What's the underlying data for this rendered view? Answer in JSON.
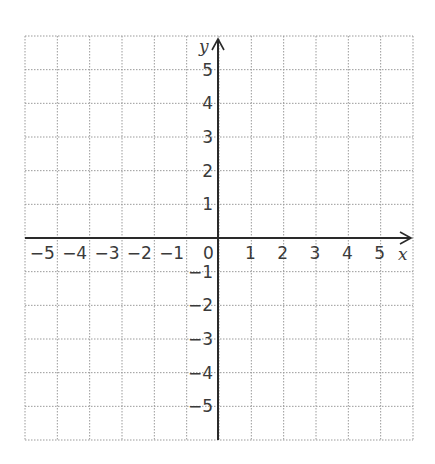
{
  "diagram": {
    "type": "cartesian-coordinate-grid",
    "grid": {
      "x_min": -6,
      "x_max": 6,
      "y_min": -6,
      "y_max": 6,
      "cells_x": 12,
      "cells_y": 12,
      "line_style": "dotted",
      "line_color": "#9a9a9a"
    },
    "axes": {
      "x_label": "x",
      "y_label": "y",
      "color": "#2a2a2a"
    },
    "origin_label": "0",
    "x_ticks": [
      {
        "value": -5,
        "label": "−5"
      },
      {
        "value": -4,
        "label": "−4"
      },
      {
        "value": -3,
        "label": "−3"
      },
      {
        "value": -2,
        "label": "−2"
      },
      {
        "value": -1,
        "label": "−1"
      },
      {
        "value": 1,
        "label": "1"
      },
      {
        "value": 2,
        "label": "2"
      },
      {
        "value": 3,
        "label": "3"
      },
      {
        "value": 4,
        "label": "4"
      },
      {
        "value": 5,
        "label": "5"
      }
    ],
    "y_ticks": [
      {
        "value": 5,
        "label": "5"
      },
      {
        "value": 4,
        "label": "4"
      },
      {
        "value": 3,
        "label": "3"
      },
      {
        "value": 2,
        "label": "2"
      },
      {
        "value": 1,
        "label": "1"
      },
      {
        "value": -1,
        "label": "−1"
      },
      {
        "value": -2,
        "label": "−2"
      },
      {
        "value": -3,
        "label": "−3"
      },
      {
        "value": -4,
        "label": "−4"
      },
      {
        "value": -5,
        "label": "−5"
      }
    ]
  }
}
